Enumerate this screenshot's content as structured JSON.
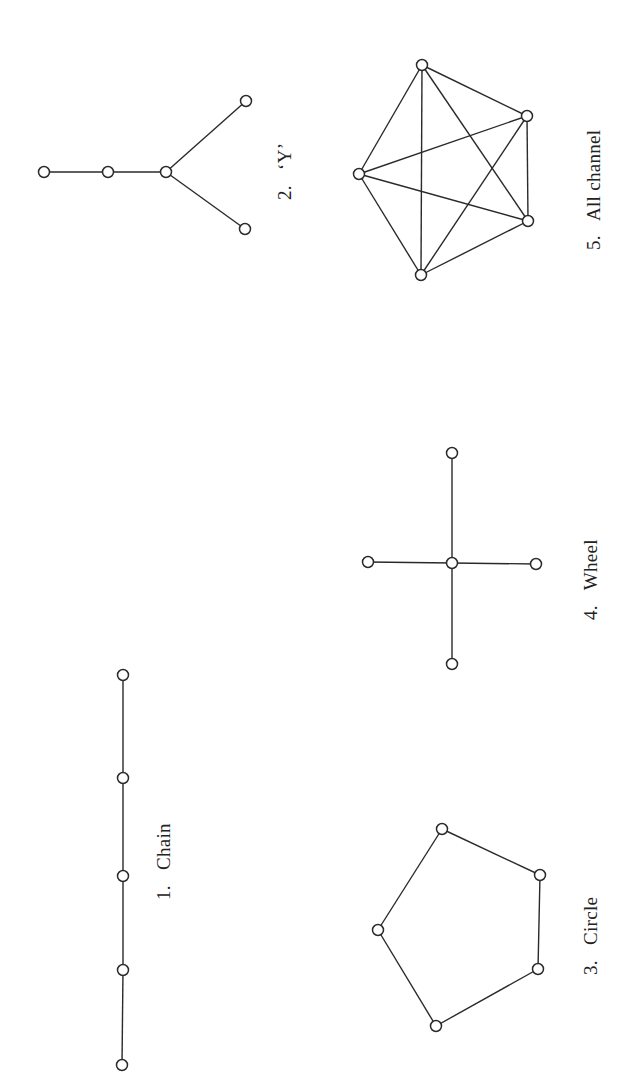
{
  "figure": {
    "colors": {
      "stroke": "#2a2a2a",
      "background": "#ffffff",
      "text": "#222222"
    },
    "networks": [
      {
        "id": "chain",
        "label": "1.   Chain",
        "nodes": [
          [
            123,
            675
          ],
          [
            123,
            778
          ],
          [
            123,
            876
          ],
          [
            123,
            970
          ],
          [
            122,
            1065
          ]
        ],
        "edges": [
          [
            0,
            1
          ],
          [
            1,
            2
          ],
          [
            2,
            3
          ],
          [
            3,
            4
          ]
        ],
        "label_pos": [
          170,
          900
        ]
      },
      {
        "id": "y",
        "label": "2.   ‘Y’",
        "nodes": [
          [
            44,
            172
          ],
          [
            108,
            172
          ],
          [
            166,
            172
          ],
          [
            246,
            101
          ],
          [
            245,
            229
          ]
        ],
        "edges": [
          [
            0,
            1
          ],
          [
            1,
            2
          ],
          [
            2,
            3
          ],
          [
            2,
            4
          ]
        ],
        "label_pos": [
          291,
          200
        ]
      },
      {
        "id": "circle",
        "label": "3.   Circle",
        "nodes": [
          [
            442,
            829
          ],
          [
            540,
            875
          ],
          [
            538,
            969
          ],
          [
            436,
            1026
          ],
          [
            378,
            930
          ]
        ],
        "edges": [
          [
            0,
            1
          ],
          [
            1,
            2
          ],
          [
            2,
            3
          ],
          [
            3,
            4
          ],
          [
            4,
            0
          ]
        ],
        "label_pos": [
          597,
          975
        ]
      },
      {
        "id": "wheel",
        "label": "4.   Wheel",
        "nodes": [
          [
            452,
            563
          ],
          [
            452,
            453
          ],
          [
            452,
            664
          ],
          [
            368,
            562
          ],
          [
            536,
            564
          ]
        ],
        "edges": [
          [
            0,
            1
          ],
          [
            0,
            2
          ],
          [
            0,
            3
          ],
          [
            0,
            4
          ]
        ],
        "label_pos": [
          597,
          620
        ]
      },
      {
        "id": "all-channel",
        "label": "5.   All channel",
        "nodes": [
          [
            422,
            65
          ],
          [
            527,
            116
          ],
          [
            528,
            221
          ],
          [
            421,
            275
          ],
          [
            359,
            174
          ]
        ],
        "edges": [
          [
            0,
            1
          ],
          [
            0,
            2
          ],
          [
            0,
            3
          ],
          [
            0,
            4
          ],
          [
            1,
            2
          ],
          [
            1,
            3
          ],
          [
            1,
            4
          ],
          [
            2,
            3
          ],
          [
            2,
            4
          ],
          [
            3,
            4
          ]
        ],
        "label_pos": [
          600,
          250
        ]
      }
    ]
  }
}
